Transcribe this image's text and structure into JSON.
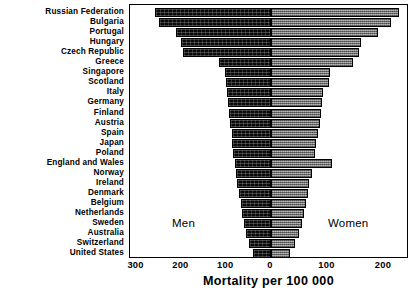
{
  "chart_data": {
    "type": "bar",
    "subtype": "diverging-population-pyramid",
    "title": "",
    "xlabel": "Mortality per 100 000",
    "ylabel": "",
    "xlim": [
      -330,
      240
    ],
    "grid": false,
    "legend_position": "inside-plot",
    "annotations": [
      {
        "text": "Men",
        "side": "left"
      },
      {
        "text": "Women",
        "side": "right"
      }
    ],
    "xticks": [
      {
        "label": "300",
        "value": -300
      },
      {
        "label": "200",
        "value": -200
      },
      {
        "label": "100",
        "value": -100
      },
      {
        "label": "0",
        "value": 0
      },
      {
        "label": "100",
        "value": 100
      },
      {
        "label": "200",
        "value": 200
      }
    ],
    "categories": [
      "Russian Federation",
      "Bulgaria",
      "Portugal",
      "Hungary",
      "Czech Republic",
      "Greece",
      "Singapore",
      "Scotland",
      "Italy",
      "Germany",
      "Finland",
      "Austria",
      "Spain",
      "Japan",
      "Poland",
      "England and Wales",
      "Norway",
      "Ireland",
      "Denmark",
      "Belgium",
      "Netherlands",
      "Sweden",
      "Australia",
      "Switzerland",
      "United States"
    ],
    "series": [
      {
        "name": "Men",
        "color": "#0a0a0a",
        "direction": "left",
        "values": [
          258,
          249,
          212,
          200,
          196,
          117,
          102,
          100,
          98,
          96,
          93,
          91,
          88,
          86,
          84,
          81,
          78,
          76,
          72,
          68,
          64,
          60,
          56,
          48,
          40
        ]
      },
      {
        "name": "Women",
        "color": "#8a8a8a",
        "direction": "right",
        "values": [
          227,
          213,
          190,
          160,
          156,
          145,
          105,
          102,
          92,
          90,
          88,
          86,
          83,
          80,
          78,
          108,
          72,
          68,
          66,
          62,
          58,
          54,
          50,
          42,
          34
        ]
      }
    ]
  },
  "axis": {
    "title": "Mortality per 100 000"
  },
  "annotations": {
    "men": "Men",
    "women": "Women"
  }
}
